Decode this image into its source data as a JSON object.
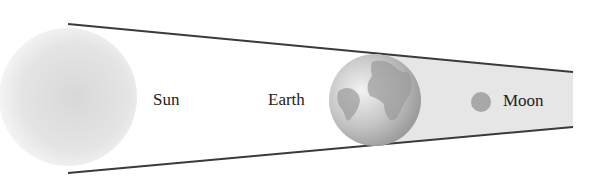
{
  "diagram": {
    "type": "lunar-eclipse",
    "labels": {
      "sun": "Sun",
      "earth": "Earth",
      "moon": "Moon"
    },
    "colors": {
      "line": "#3a3a3a",
      "shadow": "#e6e6e6",
      "sun": "#dcdcdc",
      "earth": "#b5b5b5",
      "moon": "#a8a8a8"
    }
  }
}
